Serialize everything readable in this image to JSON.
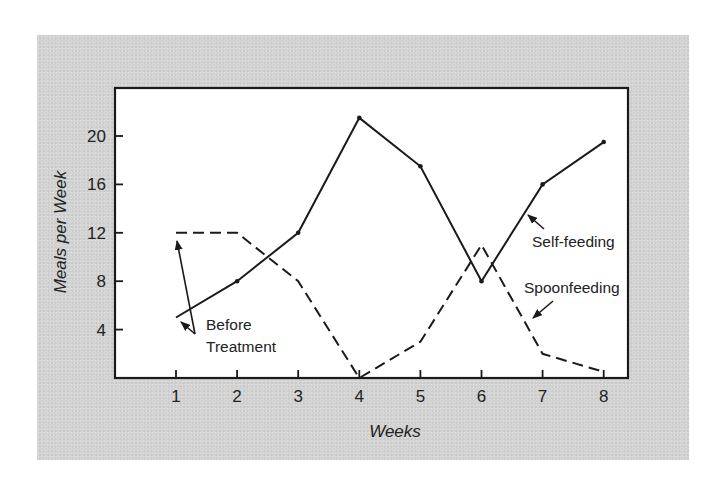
{
  "chart_data": {
    "type": "line",
    "title": "",
    "xlabel": "Weeks",
    "ylabel": "Meals per Week",
    "x": [
      1,
      2,
      3,
      4,
      5,
      6,
      7,
      8
    ],
    "xticks": [
      "1",
      "2",
      "3",
      "4",
      "5",
      "6",
      "7",
      "8"
    ],
    "yticks": [
      "4",
      "8",
      "12",
      "16",
      "20"
    ],
    "ytick_values": [
      4,
      8,
      12,
      16,
      20
    ],
    "ylim": [
      0,
      24
    ],
    "xlim": [
      0,
      8.4
    ],
    "grid": false,
    "legend": "none (inline annotations)",
    "series": [
      {
        "name": "Self-feeding",
        "style": "solid",
        "values": [
          5,
          8,
          12,
          21.5,
          17.5,
          8,
          16,
          19.5
        ]
      },
      {
        "name": "Spoonfeeding",
        "style": "dashed",
        "values": [
          12,
          12,
          8,
          0,
          3,
          11,
          2,
          0.5
        ]
      }
    ],
    "annotations": [
      {
        "text": "Self-feeding",
        "points_to": "Self-feeding line near week 6.7"
      },
      {
        "text": "Spoonfeeding",
        "points_to": "Spoonfeeding line near week 6.8"
      },
      {
        "text": "Before Treatment",
        "lines": [
          "Before",
          "Treatment"
        ],
        "points_to": "Week 1 values of both series"
      }
    ]
  },
  "labels": {
    "xlabel": "Weeks",
    "ylabel": "Meals per Week",
    "self_feeding": "Self-feeding",
    "spoonfeeding": "Spoonfeeding",
    "before": "Before",
    "treatment": "Treatment"
  },
  "colors": {
    "panel": "#d3d3d3",
    "plot_bg": "#ffffff",
    "ink": "#1a1a1a"
  }
}
